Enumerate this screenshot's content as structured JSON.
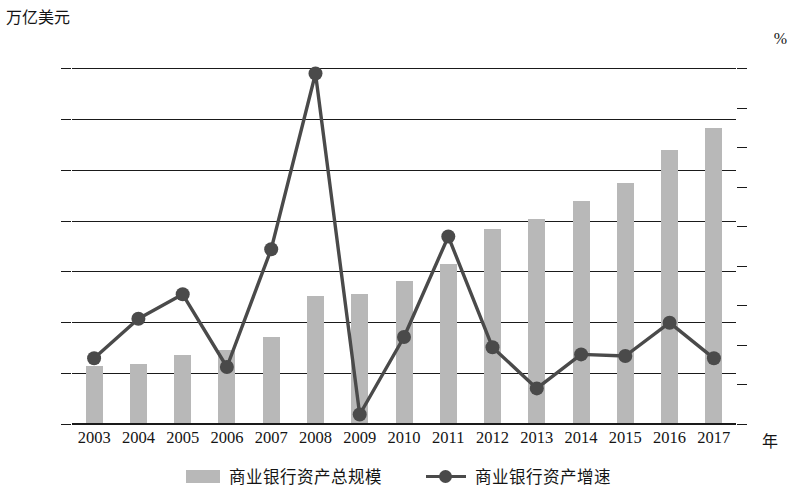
{
  "chart_data": {
    "type": "bar",
    "title": "",
    "xlabel": "年",
    "ylabel": "万亿美元",
    "ylabel_right": "%",
    "ylim": [
      0,
      35
    ],
    "ylim_right": [
      0,
      45
    ],
    "grid": true,
    "legend_position": "bottom",
    "yticks": [
      "0",
      "5",
      "10",
      "15",
      "20",
      "25",
      "30",
      "35"
    ],
    "yticks_right": [
      "0",
      "5",
      "10",
      "15",
      "20",
      "25",
      "30",
      "35",
      "40",
      "45"
    ],
    "categories": [
      "2003",
      "2004",
      "2005",
      "2006",
      "2007",
      "2008",
      "2009",
      "2010",
      "2011",
      "2012",
      "2013",
      "2014",
      "2015",
      "2016",
      "2017"
    ],
    "series": [
      {
        "name": "商业银行资产总规模",
        "kind": "bar",
        "axis": "left",
        "color": "#b8b8b8",
        "values": [
          5.7,
          5.9,
          6.8,
          7.3,
          8.6,
          12.6,
          12.8,
          14.1,
          15.7,
          19.2,
          20.2,
          21.9,
          23.7,
          26.9,
          29.1
        ]
      },
      {
        "name": "商业银行资产增速",
        "kind": "line",
        "axis": "right",
        "color": "#4a4a4a",
        "values": [
          8.3,
          13.3,
          16.4,
          7.2,
          22.1,
          44.3,
          1.2,
          11.0,
          23.7,
          9.7,
          4.5,
          8.8,
          8.6,
          12.8,
          8.3
        ]
      }
    ]
  },
  "legend": {
    "items": [
      {
        "label": "商业银行资产总规模"
      },
      {
        "label": "商业银行资产增速"
      }
    ]
  }
}
